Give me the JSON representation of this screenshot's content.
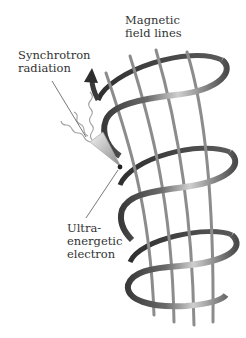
{
  "diagram": {
    "labels": {
      "magnetic_field": {
        "line1": "Magnetic",
        "line2": "field lines"
      },
      "synchrotron": {
        "line1": "Synchrotron",
        "line2": "radiation"
      },
      "electron": {
        "line1": "Ultra-",
        "line2": "energetic",
        "line3": "electron"
      }
    },
    "colors": {
      "ribbon_dark": "#3a3a3a",
      "ribbon_mid": "#8a8a8a",
      "ribbon_light": "#d8d8d8",
      "field_line": "#8c8c8c",
      "leader_line": "#555555",
      "wave": "#9a9a9a",
      "text": "#333333"
    },
    "elements": [
      "helical-ribbon",
      "magnetic-field-lines",
      "direction-arrow",
      "radiation-cone",
      "radiation-waves",
      "electron-dot"
    ]
  }
}
